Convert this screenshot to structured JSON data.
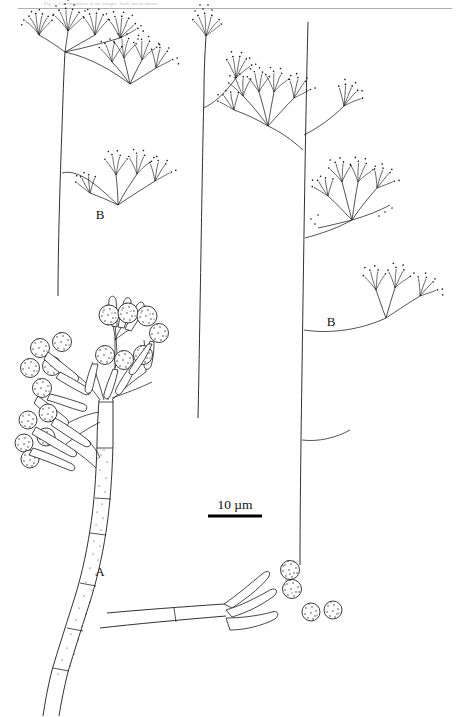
{
  "figure": {
    "kind": "scientific-line-drawing",
    "background_color": "#ffffff",
    "ink_color": "#1a1a1a",
    "top_caption_fragment": "Fig. 1. Conidiophores of the fungus. Scale bar as shown.",
    "labels": [
      {
        "id": "label-b-left",
        "text": "B",
        "x": 100,
        "y": 219
      },
      {
        "id": "label-b-right",
        "text": "B",
        "x": 331,
        "y": 326
      },
      {
        "id": "label-a",
        "text": "A",
        "x": 100,
        "y": 576
      }
    ],
    "scale": {
      "text": "10 µm",
      "text_x": 235,
      "text_y": 509,
      "bar_x1": 208,
      "bar_x2": 262,
      "bar_y": 516,
      "bar_color": "#000000"
    },
    "structures": [
      {
        "id": "structure-a",
        "label": "A",
        "description": "Branched conidiophore with stipe, club-shaped phialides and globose roughened conidial heads"
      },
      {
        "id": "structure-b-left",
        "label": "B",
        "description": "Erect sporophore bearing umbellate whorls of slender sterigmata tipped with minute conidia"
      },
      {
        "id": "structure-b-center",
        "label": "",
        "description": "Erect sporophore with two umbellate conidial heads"
      },
      {
        "id": "structure-b-right",
        "label": "B",
        "description": "Erect sporophore with several umbellate whorls of sterigmata"
      }
    ]
  }
}
